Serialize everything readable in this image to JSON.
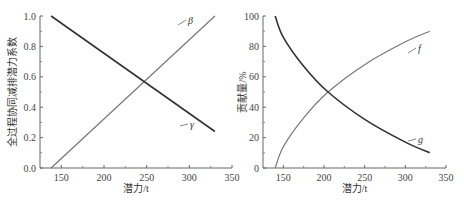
{
  "chart_data": [
    {
      "type": "line",
      "title": "",
      "xlabel": "潜力/t",
      "ylabel": "全过程协同减排潜力系数",
      "xlim": [
        125,
        350
      ],
      "ylim": [
        0.0,
        1.0
      ],
      "xticks": [
        150,
        200,
        250,
        300,
        350
      ],
      "yticks": [
        0.0,
        0.2,
        0.4,
        0.6,
        0.8,
        1.0
      ],
      "xtick_labels": [
        "150",
        "200",
        "250",
        "300",
        "350"
      ],
      "ytick_labels": [
        "0.0",
        "0.2",
        "0.4",
        "0.6",
        "0.8",
        "1.0"
      ],
      "grid": false,
      "series": [
        {
          "name": "β",
          "color": "#777777",
          "x": [
            138,
            200,
            247,
            300,
            330
          ],
          "y": [
            0.0,
            0.32,
            0.57,
            0.85,
            1.0
          ]
        },
        {
          "name": "γ",
          "color": "#333333",
          "x": [
            138,
            200,
            247,
            300,
            330
          ],
          "y": [
            1.0,
            0.76,
            0.57,
            0.36,
            0.24
          ]
        }
      ]
    },
    {
      "type": "line",
      "title": "",
      "xlabel": "潜力/t",
      "ylabel": "贡献量/%",
      "xlim": [
        125,
        350
      ],
      "ylim": [
        0,
        100
      ],
      "xticks": [
        150,
        200,
        250,
        300,
        350
      ],
      "yticks": [
        0,
        20,
        40,
        60,
        80,
        100
      ],
      "xtick_labels": [
        "150",
        "200",
        "250",
        "300",
        "350"
      ],
      "ytick_labels": [
        "0",
        "20",
        "40",
        "60",
        "80",
        "100"
      ],
      "grid": false,
      "series": [
        {
          "name": "f",
          "color": "#777777",
          "x": [
            140,
            150,
            175,
            205,
            250,
            300,
            330
          ],
          "y": [
            0,
            14,
            33,
            50,
            68,
            83,
            90
          ]
        },
        {
          "name": "g",
          "color": "#333333",
          "x": [
            140,
            150,
            175,
            205,
            250,
            300,
            330
          ],
          "y": [
            100,
            86,
            67,
            50,
            32,
            17,
            10
          ]
        }
      ]
    }
  ]
}
